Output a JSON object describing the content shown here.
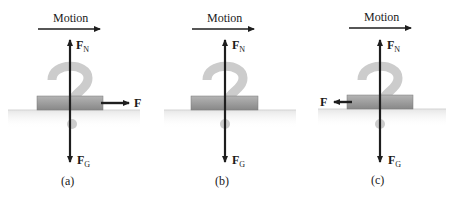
{
  "figure": {
    "panels": [
      {
        "id": "a",
        "caption": "(a)",
        "motion_label": "Motion",
        "normal_force_label": "F",
        "normal_force_sub": "N",
        "gravity_force_label": "F",
        "gravity_force_sub": "G",
        "applied_force_label": "F",
        "applied_force_direction": "right"
      },
      {
        "id": "b",
        "caption": "(b)",
        "motion_label": "Motion",
        "normal_force_label": "F",
        "normal_force_sub": "N",
        "gravity_force_label": "F",
        "gravity_force_sub": "G",
        "applied_force_label": "",
        "applied_force_direction": "none"
      },
      {
        "id": "c",
        "caption": "(c)",
        "motion_label": "Motion",
        "normal_force_label": "F",
        "normal_force_sub": "N",
        "gravity_force_label": "F",
        "gravity_force_sub": "G",
        "applied_force_label": "F",
        "applied_force_direction": "left"
      }
    ],
    "colors": {
      "arrow": "#1e1e1e",
      "block": "#9a9a9a",
      "question_mark": "#cfcfcf",
      "ground": "#d8d8d8"
    }
  }
}
